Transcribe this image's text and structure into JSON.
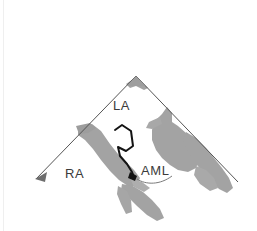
{
  "figure": {
    "kind": "echocardiogram-tracing",
    "width": 257,
    "height": 231,
    "background_color": "#ffffff"
  },
  "sector": {
    "apex": {
      "x": 136,
      "y": 76
    },
    "left_end": {
      "x": 35,
      "y": 179
    },
    "right_end": {
      "x": 238,
      "y": 182
    },
    "line_color": "#555555",
    "line_width": 1,
    "apex_marker_color": "#9a9a9a",
    "left_arrowhead_color": "#6e6e6e"
  },
  "tissue": {
    "fill_color": "#a3a3a3",
    "fill_color_light": "#b8b8b8",
    "outline_color": "#1a1a1a",
    "regions": [
      {
        "name": "apex-tissue-wedge"
      },
      {
        "name": "left-atrial-wall-band"
      },
      {
        "name": "interatrial-septum-band"
      },
      {
        "name": "right-sided-myocardium"
      },
      {
        "name": "posterior-wall-band"
      },
      {
        "name": "lower-chordal-band"
      }
    ]
  },
  "leaflet": {
    "name": "anterior-mitral-leaflet-outline",
    "stroke_color": "#141414",
    "stroke_width": 2,
    "fill": "none"
  },
  "labels": {
    "la": "LA",
    "ra": "RA",
    "aml": "AML",
    "text_color": "#3b3b3b",
    "font_size_px": 13
  },
  "leader": {
    "name": "aml-leader-line",
    "stroke_color": "#7a7a7a",
    "stroke_width": 1
  }
}
